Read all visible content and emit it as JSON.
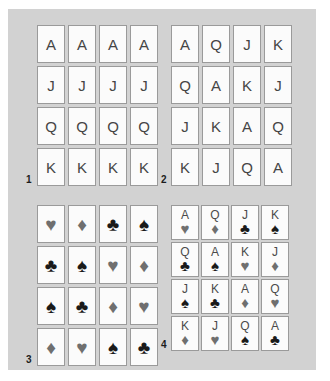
{
  "figure": {
    "background_color": "#d2d2d2",
    "card_face_color": "#fbfbfb",
    "card_border_color": "#9a9a9a",
    "suit_black_color": "#1a1a1a",
    "suit_gray_color": "#6f6f6f",
    "rank_text_color": "#454545"
  },
  "suit_glyphs": {
    "hearts": "♥",
    "diamonds": "♦",
    "clubs": "♣",
    "spades": "♠"
  },
  "grids": [
    {
      "label": "1",
      "type": "ranks-only",
      "rows": [
        [
          "A",
          "A",
          "A",
          "A"
        ],
        [
          "J",
          "J",
          "J",
          "J"
        ],
        [
          "Q",
          "Q",
          "Q",
          "Q"
        ],
        [
          "K",
          "K",
          "K",
          "K"
        ]
      ]
    },
    {
      "label": "2",
      "type": "ranks-only",
      "rows": [
        [
          "A",
          "Q",
          "J",
          "K"
        ],
        [
          "Q",
          "A",
          "K",
          "J"
        ],
        [
          "J",
          "K",
          "A",
          "Q"
        ],
        [
          "K",
          "J",
          "Q",
          "A"
        ]
      ]
    },
    {
      "label": "3",
      "type": "suits-only",
      "rows": [
        [
          {
            "suit": "♥",
            "color": "gray"
          },
          {
            "suit": "♦",
            "color": "gray"
          },
          {
            "suit": "♣",
            "color": "black"
          },
          {
            "suit": "♠",
            "color": "black"
          }
        ],
        [
          {
            "suit": "♣",
            "color": "black"
          },
          {
            "suit": "♠",
            "color": "black"
          },
          {
            "suit": "♥",
            "color": "gray"
          },
          {
            "suit": "♦",
            "color": "gray"
          }
        ],
        [
          {
            "suit": "♠",
            "color": "black"
          },
          {
            "suit": "♣",
            "color": "black"
          },
          {
            "suit": "♦",
            "color": "gray"
          },
          {
            "suit": "♥",
            "color": "gray"
          }
        ],
        [
          {
            "suit": "♦",
            "color": "gray"
          },
          {
            "suit": "♥",
            "color": "gray"
          },
          {
            "suit": "♠",
            "color": "black"
          },
          {
            "suit": "♣",
            "color": "black"
          }
        ]
      ]
    },
    {
      "label": "4",
      "type": "ranks-and-suits",
      "rows": [
        [
          {
            "rank": "A",
            "suit": "♥",
            "color": "gray"
          },
          {
            "rank": "Q",
            "suit": "♦",
            "color": "gray"
          },
          {
            "rank": "J",
            "suit": "♣",
            "color": "black"
          },
          {
            "rank": "K",
            "suit": "♠",
            "color": "black"
          }
        ],
        [
          {
            "rank": "Q",
            "suit": "♣",
            "color": "black"
          },
          {
            "rank": "A",
            "suit": "♠",
            "color": "black"
          },
          {
            "rank": "K",
            "suit": "♥",
            "color": "gray"
          },
          {
            "rank": "J",
            "suit": "♦",
            "color": "gray"
          }
        ],
        [
          {
            "rank": "J",
            "suit": "♠",
            "color": "black"
          },
          {
            "rank": "K",
            "suit": "♣",
            "color": "black"
          },
          {
            "rank": "A",
            "suit": "♦",
            "color": "gray"
          },
          {
            "rank": "Q",
            "suit": "♥",
            "color": "gray"
          }
        ],
        [
          {
            "rank": "K",
            "suit": "♦",
            "color": "gray"
          },
          {
            "rank": "J",
            "suit": "♥",
            "color": "gray"
          },
          {
            "rank": "Q",
            "suit": "♠",
            "color": "black"
          },
          {
            "rank": "A",
            "suit": "♣",
            "color": "black"
          }
        ]
      ]
    }
  ]
}
